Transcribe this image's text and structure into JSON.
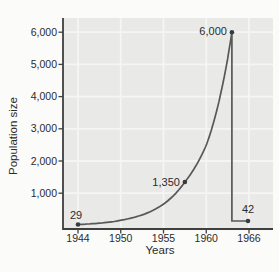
{
  "figure": {
    "background": "#fbfbf9",
    "plot_background": "#e9e9e7",
    "grid_color": "#f5f5f3",
    "axis_color": "#3f3f3f",
    "curve_color": "#585858",
    "point_color": "#3b3b3b",
    "text_color": "#2b2b2b"
  },
  "chart_data": {
    "type": "line",
    "title": "",
    "xlabel": "Years",
    "ylabel": "Population size",
    "x_ticks": [
      {
        "label": "1944",
        "year": 1944
      },
      {
        "label": "1950",
        "year": 1950
      },
      {
        "label": "1955",
        "year": 1955
      },
      {
        "label": "1960",
        "year": 1960
      },
      {
        "label": "1966",
        "year": 1966
      }
    ],
    "y_ticks": [
      {
        "label": "6,000",
        "value": 6000
      },
      {
        "label": "5,000",
        "value": 5000
      },
      {
        "label": "4,000",
        "value": 4000
      },
      {
        "label": "3,000",
        "value": 3000
      },
      {
        "label": "2,000",
        "value": 2000
      },
      {
        "label": "1,000",
        "value": 1000
      }
    ],
    "ylim": [
      0,
      6300
    ],
    "grid": true,
    "legend": "none",
    "points": [
      {
        "year": 1944,
        "value": 29,
        "label": "29"
      },
      {
        "year": 1957.5,
        "value": 1350,
        "label": "1,350"
      },
      {
        "year": 1963.6,
        "value": 6000,
        "label": "6,000"
      },
      {
        "year": 1966,
        "value": 42,
        "label": "42"
      }
    ],
    "shape_note": "exponential growth from 29 to peak 6,000, vertical crash, then flat to 42 in 1966"
  }
}
